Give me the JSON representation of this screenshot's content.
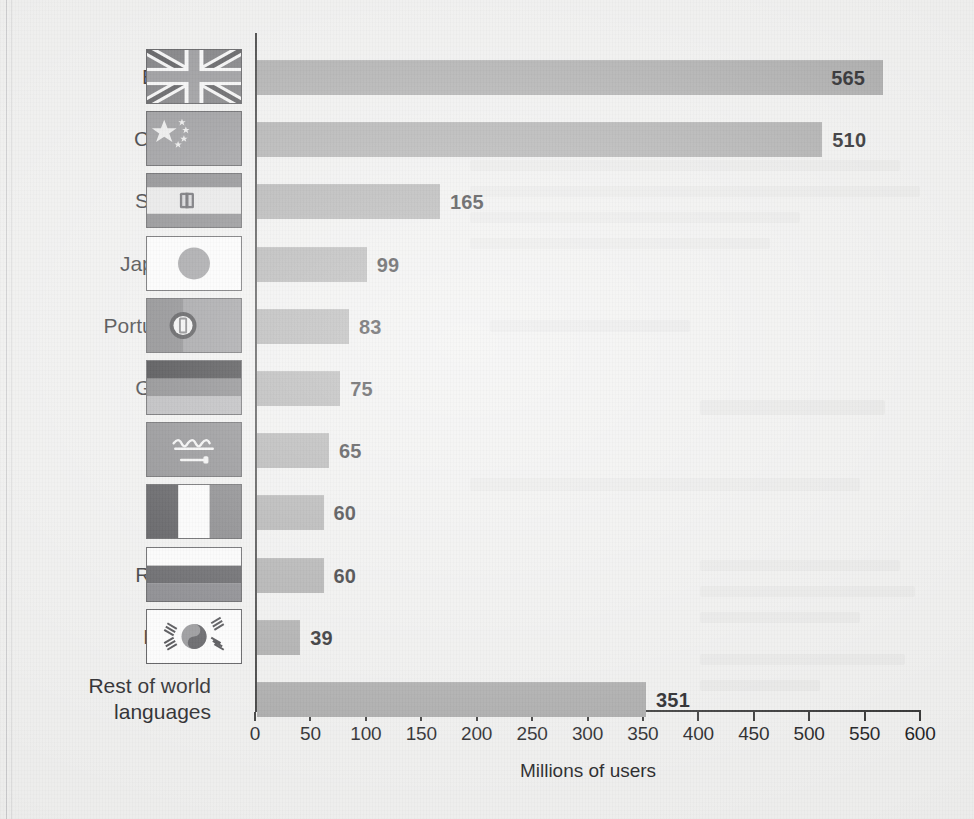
{
  "chart_data": {
    "type": "bar",
    "orientation": "horizontal",
    "title": "",
    "xlabel": "Millions of users",
    "ylabel": "",
    "xlim": [
      0,
      600
    ],
    "xticks": [
      0,
      50,
      100,
      150,
      200,
      250,
      300,
      350,
      400,
      450,
      500,
      550,
      600
    ],
    "xtick_labels": [
      "0",
      "50",
      "100",
      "150",
      "200",
      "250",
      "300",
      "350",
      "400",
      "450",
      "500",
      "550",
      "600"
    ],
    "grid": false,
    "legend": null,
    "bar_color": "#a2a2a2",
    "value_labels_shown": true,
    "categories": [
      "English",
      "Chinese",
      "Spanish",
      "Japanese",
      "Portuguese",
      "German",
      "Arabic",
      "French",
      "Russian",
      "Korean",
      "Rest of world\nlanguages"
    ],
    "values": [
      565,
      510,
      165,
      99,
      83,
      75,
      65,
      60,
      60,
      39,
      351
    ]
  },
  "rows": [
    {
      "label": "English",
      "value": 565,
      "value_text": "565",
      "flag": "flag-united-kingdom"
    },
    {
      "label": "Chinese",
      "value": 510,
      "value_text": "510",
      "flag": "flag-china"
    },
    {
      "label": "Spanish",
      "value": 165,
      "value_text": "165",
      "flag": "flag-spain"
    },
    {
      "label": "Japanese",
      "value": 99,
      "value_text": "99",
      "flag": "flag-japan"
    },
    {
      "label": "Portuguese",
      "value": 83,
      "value_text": "83",
      "flag": "flag-portugal"
    },
    {
      "label": "German",
      "value": 75,
      "value_text": "75",
      "flag": "flag-germany"
    },
    {
      "label": "Arabic",
      "value": 65,
      "value_text": "65",
      "flag": "flag-saudi-arabia"
    },
    {
      "label": "French",
      "value": 60,
      "value_text": "60",
      "flag": "flag-france"
    },
    {
      "label": "Russian",
      "value": 60,
      "value_text": "60",
      "flag": "flag-russia"
    },
    {
      "label": "Korean",
      "value": 39,
      "value_text": "39",
      "flag": "flag-south-korea"
    },
    {
      "label": "Rest of world\nlanguages",
      "value": 351,
      "value_text": "351",
      "flag": null
    }
  ],
  "axis": {
    "x_title": "Millions of users",
    "ticks": [
      "0",
      "50",
      "100",
      "150",
      "200",
      "250",
      "300",
      "350",
      "400",
      "450",
      "500",
      "550",
      "600"
    ]
  },
  "colors": {
    "background": "#ededec",
    "bar": "#a2a2a2",
    "axis": "#2d2d2d",
    "text": "#17171a"
  }
}
